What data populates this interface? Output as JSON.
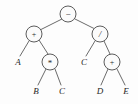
{
  "figure": {
    "expression": "(A + B * C) - (C / (D + E))",
    "background_color": "#fdfdfd",
    "stroke_color": "#4a4a4a",
    "edge_color": "#5a5a5a",
    "text_color": "#1f1f1f",
    "width": 138,
    "height": 104
  },
  "nodes": [
    {
      "id": "root",
      "label": "−",
      "kind": "operator",
      "name": "minus",
      "cx": 68,
      "cy": 14,
      "r": 8
    },
    {
      "id": "left",
      "label": "+",
      "kind": "operator",
      "name": "plus",
      "cx": 34,
      "cy": 34,
      "r": 8
    },
    {
      "id": "right",
      "label": "/",
      "kind": "operator",
      "name": "divide",
      "cx": 100,
      "cy": 34,
      "r": 8
    },
    {
      "id": "leftmul",
      "label": "*",
      "kind": "operator",
      "name": "multiply",
      "cx": 50,
      "cy": 62,
      "r": 8
    },
    {
      "id": "rightplus",
      "label": "+",
      "kind": "operator",
      "name": "plus",
      "cx": 112,
      "cy": 62,
      "r": 8
    }
  ],
  "leaves": [
    {
      "id": "leafA",
      "label": "A",
      "x": 18,
      "y": 62
    },
    {
      "id": "leafB",
      "label": "B",
      "x": 36,
      "y": 91
    },
    {
      "id": "leafC",
      "label": "C",
      "x": 62,
      "y": 91
    },
    {
      "id": "leafC2",
      "label": "C",
      "x": 84,
      "y": 62
    },
    {
      "id": "leafD",
      "label": "D",
      "x": 100,
      "y": 91
    },
    {
      "id": "leafE",
      "label": "E",
      "x": 126,
      "y": 91
    }
  ],
  "edges": [
    {
      "id": "e-root-left",
      "from": "root",
      "to": "left",
      "x1": 62,
      "y1": 19,
      "x2": 40,
      "y2": 30
    },
    {
      "id": "e-root-right",
      "from": "root",
      "to": "right",
      "x1": 75,
      "y1": 19,
      "x2": 95,
      "y2": 29
    },
    {
      "id": "e-left-leafA",
      "from": "left",
      "to": "leafA",
      "x1": 29,
      "y1": 41,
      "x2": 20,
      "y2": 56
    },
    {
      "id": "e-left-mul",
      "from": "left",
      "to": "leftmul",
      "x1": 39,
      "y1": 40,
      "x2": 48,
      "y2": 54
    },
    {
      "id": "e-mul-leafB",
      "from": "leftmul",
      "to": "leafB",
      "x1": 46,
      "y1": 69,
      "x2": 38,
      "y2": 85
    },
    {
      "id": "e-mul-leafC",
      "from": "leftmul",
      "to": "leafC",
      "x1": 55,
      "y1": 69,
      "x2": 61,
      "y2": 85
    },
    {
      "id": "e-right-leafC2",
      "from": "right",
      "to": "leafC2",
      "x1": 95,
      "y1": 41,
      "x2": 86,
      "y2": 56
    },
    {
      "id": "e-right-plus",
      "from": "right",
      "to": "rightplus",
      "x1": 104,
      "y1": 41,
      "x2": 110,
      "y2": 54
    },
    {
      "id": "e-plus-leafD",
      "from": "rightplus",
      "to": "leafD",
      "x1": 108,
      "y1": 69,
      "x2": 101,
      "y2": 85
    },
    {
      "id": "e-plus-leafE",
      "from": "rightplus",
      "to": "leafE",
      "x1": 117,
      "y1": 69,
      "x2": 125,
      "y2": 85
    }
  ]
}
